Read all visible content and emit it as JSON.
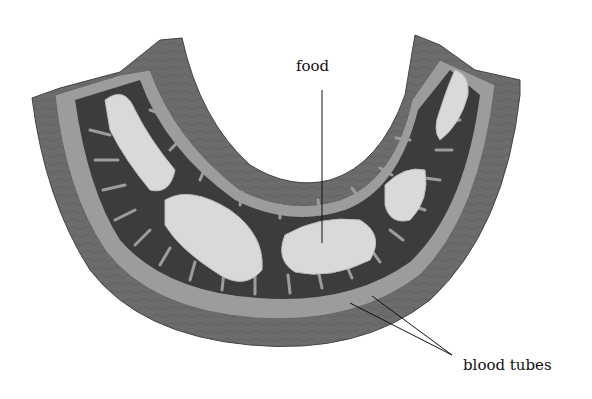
{
  "diagram": {
    "labels": {
      "food": "food",
      "blood_tubes": "blood tubes"
    },
    "colors": {
      "background": "#ffffff",
      "outer_muscle": "#6e6e6e",
      "inner_layer": "#9a9a9a",
      "villi_dark": "#3a3a3a",
      "food_light": "#d8d8d8",
      "leader_line": "#111111"
    }
  }
}
